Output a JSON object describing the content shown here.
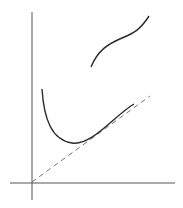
{
  "diagram": {
    "background": "#ffffff",
    "stroke_color": "#2a2a2a",
    "axis_color": "#555555",
    "dashed_color": "#666666",
    "axes": {
      "x_axis": {
        "x1": 10,
        "y1": 183,
        "x2": 175,
        "y2": 183
      },
      "y_axis": {
        "x1": 32,
        "y1": 12,
        "x2": 32,
        "y2": 200
      }
    },
    "curves": [
      {
        "name": "upper-curve",
        "path": "M91,67 C98,50 108,44 122,38 C134,33 140,30 149,16"
      },
      {
        "name": "lower-curve",
        "path": "M42,89 C44,120 52,140 72,143 C92,146 115,115 134,104"
      },
      {
        "name": "dashed-asymptote",
        "path": "M32,182 L150,96"
      }
    ]
  }
}
